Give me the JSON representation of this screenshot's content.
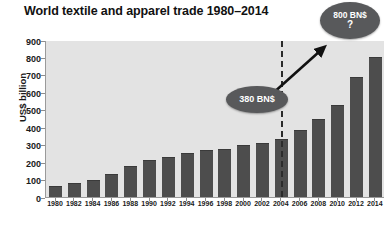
{
  "chart_data": {
    "type": "bar",
    "title": "World textile and apparel trade 1980–2014",
    "xlabel": "",
    "ylabel": "US$ billion",
    "ylim": [
      0,
      900
    ],
    "ytick_step": 100,
    "yticks": [
      900,
      800,
      700,
      600,
      500,
      400,
      300,
      200,
      100,
      0
    ],
    "grid": false,
    "legend": "none",
    "categories": [
      "1980",
      "1982",
      "1984",
      "1986",
      "1988",
      "1990",
      "1992",
      "1994",
      "1996",
      "1998",
      "2000",
      "2002",
      "2004",
      "2006",
      "2008",
      "2010",
      "2012",
      "2014"
    ],
    "values": [
      65,
      80,
      100,
      130,
      175,
      215,
      230,
      250,
      270,
      275,
      300,
      310,
      330,
      385,
      450,
      530,
      690,
      800
    ],
    "annotations": [
      {
        "name": "divider",
        "type": "vertical-dashed-line",
        "at_category": "2005"
      },
      {
        "name": "growth-arrow",
        "type": "arrow",
        "from": "2004",
        "to": "2014"
      },
      {
        "name": "callout-380",
        "type": "ellipse-callout",
        "label": "380 BN$"
      },
      {
        "name": "callout-800",
        "type": "ellipse-callout",
        "label": "800 BN$",
        "sublabel": "?"
      }
    ]
  },
  "colors": {
    "bar": "#4d4d4d",
    "plot_background": "#e3e3e3",
    "page_background": "#ffffff",
    "callout": "#58595b",
    "axis": "#8d8d8d",
    "text": "#1a1a1a"
  }
}
